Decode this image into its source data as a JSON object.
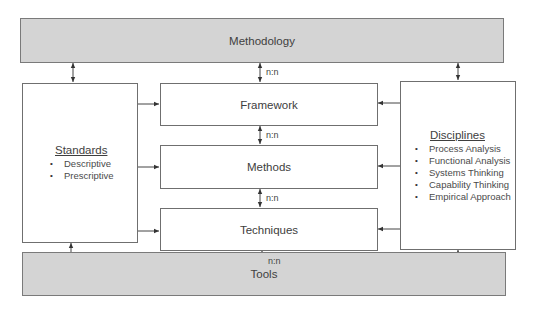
{
  "diagram": {
    "top_bar": {
      "label": "Methodology"
    },
    "bottom_bar": {
      "label": "Tools"
    },
    "center_boxes": [
      {
        "label": "Framework"
      },
      {
        "label": "Methods"
      },
      {
        "label": "Techniques"
      }
    ],
    "left_box": {
      "title": "Standards",
      "items": [
        "Descriptive",
        "Prescriptive"
      ]
    },
    "right_box": {
      "title": "Disciplines",
      "items": [
        "Process Analysis",
        "Functional Analysis",
        "Systems Thinking",
        "Capability Thinking",
        "Empirical Approach"
      ]
    },
    "relations": {
      "methodology_framework": "n:n",
      "framework_methods": "n:n",
      "methods_techniques": "n:n",
      "techniques_tools": "n:n"
    },
    "colors": {
      "bar_fill": "#d4d4d4",
      "border": "#6f6f6f",
      "arrow": "#333333"
    }
  }
}
